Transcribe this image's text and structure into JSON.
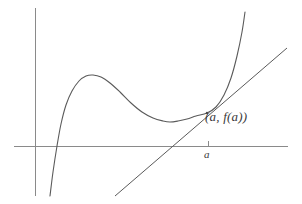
{
  "figure": {
    "title": "",
    "background_color": "#ffffff",
    "stroke_color": "#5a5a5a",
    "axis_color": "#8a8a8a",
    "label_color": "#3a3a3a"
  },
  "labels": {
    "point_label": "(a, f(a))",
    "tick_label": "a"
  },
  "chart_data": {
    "type": "line",
    "title": "",
    "xlabel": "",
    "ylabel": "",
    "grid": false,
    "legend": null,
    "axes": {
      "x_axis": {
        "y_pixel": 146,
        "x_start": 14,
        "x_end": 288
      },
      "y_axis": {
        "x_pixel": 35,
        "y_start": 8,
        "y_end": 196
      },
      "origin": [
        35,
        146
      ]
    },
    "ticks": {
      "x": [
        {
          "label": "a",
          "pixel_x": 208
        }
      ],
      "y": []
    },
    "annotations": [
      {
        "text": "(a, f(a))",
        "anchor_pixel": [
          207,
          113
        ],
        "label_pixel": [
          205,
          109
        ],
        "description": "point of tangency on the curve"
      },
      {
        "text": "a",
        "anchor_pixel": [
          208,
          146
        ],
        "label_pixel": [
          204,
          148
        ],
        "description": "x-axis tick label under point of tangency"
      }
    ],
    "series": [
      {
        "name": "f(x)",
        "type": "curve",
        "description": "cubic-like curve rising steeply from lower left, local maximum, local minimum, then rising steeply to upper right",
        "features": {
          "x_intercept_pixel": [
            57,
            146
          ],
          "local_max_pixel": [
            93,
            75
          ],
          "local_min_pixel": [
            170,
            122
          ],
          "tangency_pixel": [
            207,
            113
          ]
        },
        "path_points": [
          [
            50,
            196
          ],
          [
            53,
            172
          ],
          [
            57,
            146
          ],
          [
            61,
            124
          ],
          [
            66,
            105
          ],
          [
            72,
            91
          ],
          [
            79,
            81
          ],
          [
            86,
            76
          ],
          [
            93,
            75
          ],
          [
            101,
            77
          ],
          [
            110,
            83
          ],
          [
            120,
            92
          ],
          [
            131,
            103
          ],
          [
            142,
            112
          ],
          [
            153,
            118
          ],
          [
            163,
            121
          ],
          [
            170,
            122
          ],
          [
            178,
            121
          ],
          [
            187,
            119
          ],
          [
            196,
            116
          ],
          [
            207,
            113
          ],
          [
            216,
            107
          ],
          [
            224,
            95
          ],
          [
            231,
            78
          ],
          [
            237,
            56
          ],
          [
            242,
            32
          ],
          [
            245,
            12
          ]
        ]
      },
      {
        "name": "tangent line at a",
        "type": "line",
        "description": "straight tangent line touching the curve at (a, f(a))",
        "endpoints_pixel": [
          [
            115,
            196
          ],
          [
            287,
            48
          ]
        ],
        "x_axis_crossing_pixel": [
          173,
          146
        ],
        "slope_pixel": -0.86
      }
    ]
  }
}
